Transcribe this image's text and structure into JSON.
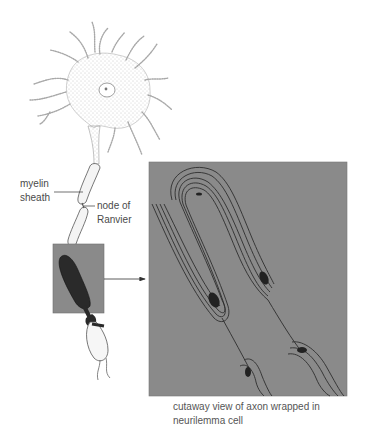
{
  "diagram": {
    "labels": {
      "myelin_sheath": [
        "myelin",
        "sheath"
      ],
      "node_of_ranvier": [
        "node of",
        "Ranvier"
      ]
    },
    "caption": [
      "cutaway view of axon wrapped in",
      "neurilemma cell"
    ],
    "colors": {
      "panel_fill": "#8a8a8a",
      "line": "#333333",
      "dark": "#2a2a2a",
      "label_text": "#4a4a4a"
    }
  }
}
